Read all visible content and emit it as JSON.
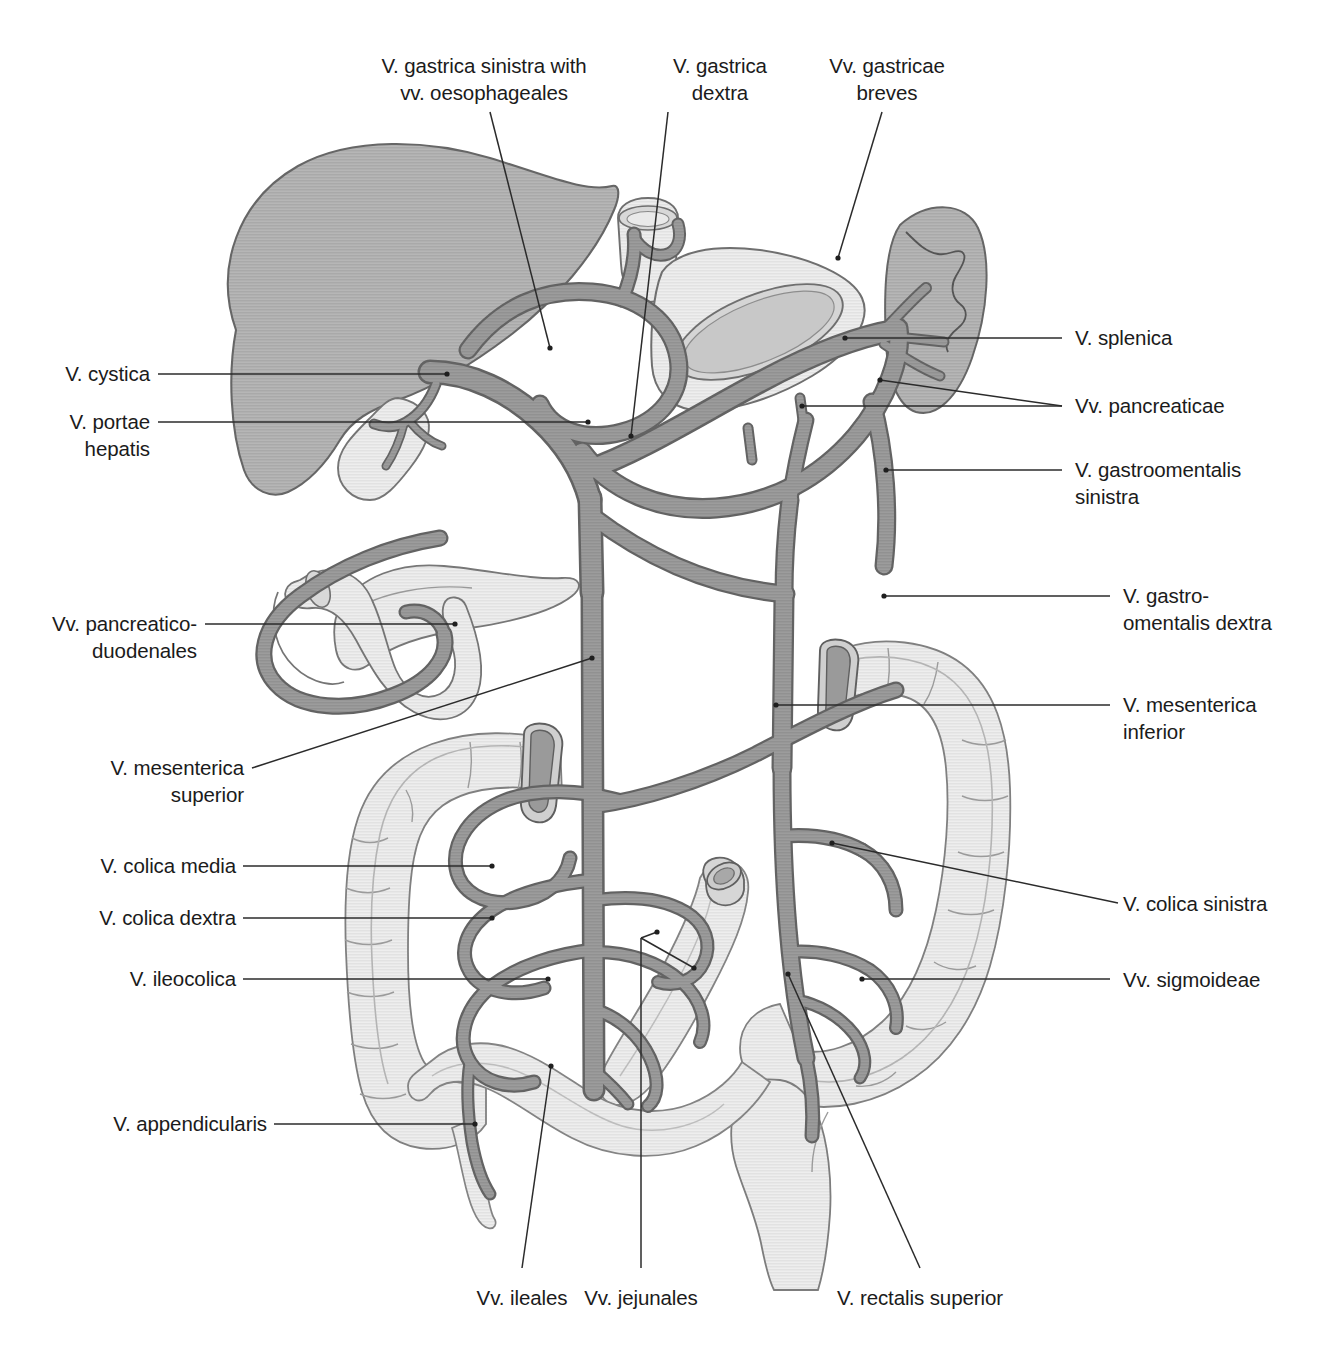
{
  "figure": {
    "colors": {
      "vessel_fill": "#9a9a9a",
      "vessel_stroke": "#6e6e6e",
      "liver_fill": "#b2b2b2",
      "organ_light_fill": "#ededed",
      "organ_mid_fill": "#dcdcdc",
      "outline": "#6f6f6f",
      "leader_line": "#2a2a2a",
      "text": "#1b1b1b",
      "background": "#ffffff"
    },
    "organs": [
      {
        "name": "liver",
        "label": ""
      },
      {
        "name": "gallbladder",
        "label": ""
      },
      {
        "name": "stomach",
        "label": ""
      },
      {
        "name": "spleen",
        "label": ""
      },
      {
        "name": "pancreas",
        "label": ""
      },
      {
        "name": "duodenum",
        "label": ""
      },
      {
        "name": "ascending-colon",
        "label": ""
      },
      {
        "name": "transverse-colon",
        "label": ""
      },
      {
        "name": "descending-colon",
        "label": ""
      },
      {
        "name": "sigmoid-colon",
        "label": ""
      },
      {
        "name": "rectum",
        "label": ""
      },
      {
        "name": "jejunum",
        "label": ""
      },
      {
        "name": "ileum",
        "label": ""
      },
      {
        "name": "appendix",
        "label": ""
      },
      {
        "name": "oesophagus",
        "label": ""
      }
    ]
  },
  "labels": {
    "gastrica_sinistra": "V. gastrica sinistra with\nvv. oesophageales",
    "gastrica_dextra": "V. gastrica\ndextra",
    "gastricae_breves": "Vv. gastricae\nbreves",
    "splenica": "V. splenica",
    "pancreaticae": "Vv. pancreaticae",
    "gastroomentalis_sinistra": "V. gastroomentalis\nsinistra",
    "gastroomentalis_dextra": "V. gastro-\nomentalis dextra",
    "mesenterica_inferior": "V. mesenterica\ninferior",
    "colica_sinistra": "V. colica sinistra",
    "sigmoideae": "Vv. sigmoideae",
    "cystica": "V. cystica",
    "portae_hepatis": "V. portae\nhepatis",
    "pancreaticoduodenales": "Vv. pancreatico-\nduodenales",
    "mesenterica_superior": "V. mesenterica\nsuperior",
    "colica_media": "V. colica media",
    "colica_dextra": "V. colica dextra",
    "ileocolica": "V. ileocolica",
    "appendicularis": "V. appendicularis",
    "ileales": "Vv. ileales",
    "jejunales": "Vv. jejunales",
    "rectalis_superior": "V. rectalis superior"
  }
}
